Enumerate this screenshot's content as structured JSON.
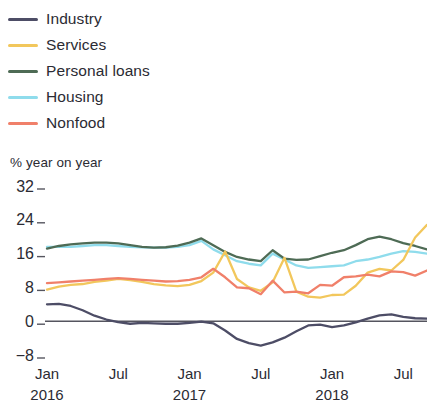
{
  "legend": {
    "position": "top-left",
    "items": [
      {
        "label": "Industry",
        "color": "#4d4d66",
        "key": "industry"
      },
      {
        "label": "Services",
        "color": "#f2c75c",
        "key": "services"
      },
      {
        "label": "Personal loans",
        "color": "#4e6b55",
        "key": "personal_loans"
      },
      {
        "label": "Housing",
        "color": "#8fdcec",
        "key": "housing"
      },
      {
        "label": "Nonfood",
        "color": "#f0806a",
        "key": "nonfood"
      }
    ]
  },
  "axis_title": "% year on year",
  "chart_data": {
    "type": "line",
    "title": "",
    "subtitle": "",
    "xlabel": "",
    "ylabel": "% year on year",
    "ylim": [
      -8,
      32
    ],
    "xlim": [
      0,
      32
    ],
    "grid": false,
    "zero_line": true,
    "y_ticks": [
      32,
      24,
      16,
      8,
      0,
      -8
    ],
    "y_tick_labels": [
      "32",
      "24",
      "16",
      "8",
      "0",
      "−8"
    ],
    "x_ticks": [
      0,
      6,
      12,
      18,
      24,
      30
    ],
    "x_tick_labels": [
      "Jan",
      "Jul",
      "Jan",
      "Jul",
      "Jan",
      "Jul"
    ],
    "x_tick_sublabels": [
      "2016",
      "",
      "2017",
      "",
      "2018",
      ""
    ],
    "x": [
      0,
      1,
      2,
      3,
      4,
      5,
      6,
      7,
      8,
      9,
      10,
      11,
      12,
      13,
      14,
      15,
      16,
      17,
      18,
      19,
      20,
      21,
      22,
      23,
      24,
      25,
      26,
      27,
      28,
      29,
      30,
      31,
      32
    ],
    "series": [
      {
        "name": "Industry",
        "color": "#4d4d66",
        "values": [
          4.0,
          4.1,
          3.6,
          2.6,
          1.3,
          0.4,
          -0.2,
          -0.6,
          -0.4,
          -0.5,
          -0.6,
          -0.6,
          -0.4,
          -0.1,
          -0.5,
          -2.2,
          -4.2,
          -5.2,
          -5.8,
          -5.0,
          -3.9,
          -2.4,
          -1.0,
          -0.8,
          -1.4,
          -1.0,
          -0.3,
          0.6,
          1.4,
          1.6,
          1.0,
          0.7,
          0.6
        ]
      },
      {
        "name": "Services",
        "color": "#f2c75c",
        "values": [
          7.5,
          8.2,
          8.6,
          8.8,
          9.3,
          9.6,
          10.0,
          9.7,
          9.3,
          8.8,
          8.5,
          8.3,
          8.6,
          9.5,
          11.5,
          16.5,
          10.0,
          8.0,
          7.2,
          9.2,
          15.0,
          7.0,
          5.8,
          5.6,
          6.2,
          6.3,
          8.4,
          11.5,
          12.4,
          12.0,
          14.5,
          19.8,
          22.8
        ]
      },
      {
        "name": "Personal loans",
        "color": "#4e6b55",
        "values": [
          17.2,
          17.8,
          18.2,
          18.4,
          18.6,
          18.6,
          18.4,
          18.0,
          17.6,
          17.4,
          17.5,
          17.9,
          18.6,
          19.6,
          18.0,
          16.4,
          15.2,
          14.6,
          14.2,
          16.8,
          14.8,
          14.5,
          14.6,
          15.4,
          16.2,
          16.8,
          18.0,
          19.4,
          20.0,
          19.4,
          18.5,
          17.8,
          17.0
        ]
      },
      {
        "name": "Housing",
        "color": "#8fdcec",
        "values": [
          17.6,
          17.6,
          17.6,
          17.8,
          18.0,
          18.0,
          17.8,
          17.6,
          17.5,
          17.4,
          17.4,
          17.6,
          18.0,
          19.0,
          17.0,
          15.6,
          14.2,
          13.6,
          13.2,
          16.0,
          14.6,
          13.2,
          12.6,
          12.8,
          13.0,
          13.2,
          14.2,
          14.6,
          15.2,
          16.0,
          16.6,
          16.4,
          16.0
        ]
      },
      {
        "name": "Nonfood",
        "color": "#f0806a",
        "values": [
          9.0,
          9.2,
          9.4,
          9.6,
          9.8,
          10.0,
          10.2,
          10.0,
          9.8,
          9.6,
          9.4,
          9.5,
          9.8,
          10.4,
          12.4,
          10.4,
          8.0,
          7.8,
          6.4,
          9.6,
          6.8,
          7.0,
          6.6,
          8.6,
          8.4,
          10.4,
          10.6,
          11.0,
          10.6,
          11.8,
          11.6,
          10.8,
          12.0
        ]
      }
    ]
  }
}
